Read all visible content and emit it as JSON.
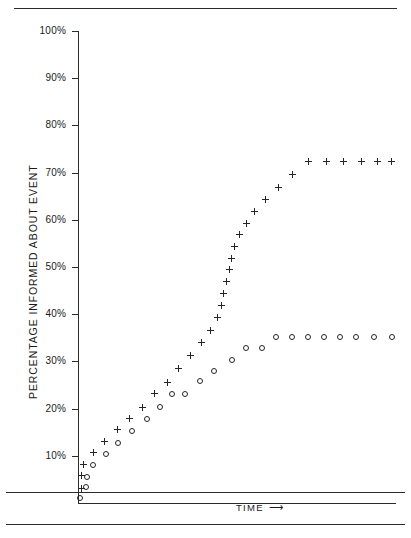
{
  "figure": {
    "caption": ""
  },
  "chart_data": {
    "type": "scatter",
    "title": "",
    "xlabel": "TIME",
    "xlabel_arrow": "⟶",
    "ylabel": "PERCENTAGE INFORMED ABOUT EVENT",
    "ylim": [
      0,
      100
    ],
    "xlim": [
      0,
      100
    ],
    "grid": false,
    "legend": "none",
    "y_ticks": [
      {
        "value": 100,
        "label": "100%"
      },
      {
        "value": 90,
        "label": "90%"
      },
      {
        "value": 80,
        "label": "80%"
      },
      {
        "value": 70,
        "label": "70%"
      },
      {
        "value": 60,
        "label": "60%"
      },
      {
        "value": 50,
        "label": "50%"
      },
      {
        "value": 40,
        "label": "40%"
      },
      {
        "value": 30,
        "label": "30%"
      },
      {
        "value": 20,
        "label": "20%"
      },
      {
        "value": 10,
        "label": "10%"
      }
    ],
    "x_ticks": [],
    "series": [
      {
        "name": "plus-series",
        "marker": "plus",
        "color": "#262626",
        "points": [
          {
            "x": 1.0,
            "y": 3.0
          },
          {
            "x": 1.0,
            "y": 5.8
          },
          {
            "x": 1.6,
            "y": 8.2
          },
          {
            "x": 4.7,
            "y": 10.6
          },
          {
            "x": 8.2,
            "y": 13.0
          },
          {
            "x": 12.2,
            "y": 15.5
          },
          {
            "x": 16.0,
            "y": 17.9
          },
          {
            "x": 20.0,
            "y": 20.3
          },
          {
            "x": 24.0,
            "y": 23.1
          },
          {
            "x": 28.0,
            "y": 25.6
          },
          {
            "x": 31.5,
            "y": 28.6
          },
          {
            "x": 35.0,
            "y": 31.2
          },
          {
            "x": 38.5,
            "y": 34.1
          },
          {
            "x": 41.5,
            "y": 36.6
          },
          {
            "x": 43.5,
            "y": 39.4
          },
          {
            "x": 44.8,
            "y": 41.9
          },
          {
            "x": 45.6,
            "y": 44.4
          },
          {
            "x": 46.4,
            "y": 46.9
          },
          {
            "x": 47.2,
            "y": 49.4
          },
          {
            "x": 48.0,
            "y": 51.9
          },
          {
            "x": 49.0,
            "y": 54.4
          },
          {
            "x": 50.5,
            "y": 56.8
          },
          {
            "x": 52.5,
            "y": 59.3
          },
          {
            "x": 55.0,
            "y": 61.8
          },
          {
            "x": 58.5,
            "y": 64.3
          },
          {
            "x": 62.5,
            "y": 66.8
          },
          {
            "x": 67.0,
            "y": 69.6
          },
          {
            "x": 72.0,
            "y": 72.4
          },
          {
            "x": 77.5,
            "y": 72.4
          },
          {
            "x": 83.0,
            "y": 72.4
          },
          {
            "x": 88.5,
            "y": 72.4
          },
          {
            "x": 93.5,
            "y": 72.4
          },
          {
            "x": 98.0,
            "y": 72.4
          }
        ]
      },
      {
        "name": "circle-series",
        "marker": "circle",
        "color": "#262626",
        "points": [
          {
            "x": 0.7,
            "y": 1.0
          },
          {
            "x": 2.4,
            "y": 3.3
          },
          {
            "x": 2.9,
            "y": 5.6
          },
          {
            "x": 4.8,
            "y": 8.0
          },
          {
            "x": 8.6,
            "y": 10.3
          },
          {
            "x": 12.6,
            "y": 12.8
          },
          {
            "x": 17.0,
            "y": 15.3
          },
          {
            "x": 21.5,
            "y": 17.9
          },
          {
            "x": 25.5,
            "y": 20.3
          },
          {
            "x": 29.5,
            "y": 23.0
          },
          {
            "x": 33.5,
            "y": 23.0
          },
          {
            "x": 38.0,
            "y": 25.9
          },
          {
            "x": 42.5,
            "y": 28.0
          },
          {
            "x": 48.0,
            "y": 30.2
          },
          {
            "x": 52.5,
            "y": 32.8
          },
          {
            "x": 57.5,
            "y": 32.8
          },
          {
            "x": 62.0,
            "y": 35.1
          },
          {
            "x": 67.0,
            "y": 35.1
          },
          {
            "x": 72.0,
            "y": 35.1
          },
          {
            "x": 77.0,
            "y": 35.1
          },
          {
            "x": 82.0,
            "y": 35.1
          },
          {
            "x": 87.0,
            "y": 35.1
          },
          {
            "x": 92.5,
            "y": 35.1
          },
          {
            "x": 98.0,
            "y": 35.1
          }
        ]
      }
    ]
  }
}
